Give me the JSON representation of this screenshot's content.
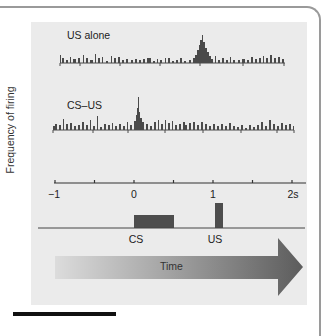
{
  "figure": {
    "y_axis_label": "Frequency of firing",
    "traces": [
      {
        "label": "US alone",
        "peak_at_s": 1.1,
        "description": "peri-stimulus histogram; response peak after US onset"
      },
      {
        "label": "CS–US",
        "peak_at_s": 0.1,
        "description": "peri-stimulus histogram; response peak shifted to CS onset"
      }
    ],
    "time_axis": {
      "ticks": [
        "−1",
        "0",
        "1",
        "2s"
      ],
      "minor_ticks_at": [
        -0.5,
        0.5,
        1.5
      ]
    },
    "events": [
      {
        "label": "CS",
        "start_s": 0,
        "end_s": 0.5
      },
      {
        "label": "US",
        "start_s": 1.0,
        "end_s": 1.1
      }
    ],
    "arrow_label": "Time",
    "colors": {
      "panel_bg": "#ebebeb",
      "histogram": "#4a4a4a",
      "event_block": "#4d4d4d",
      "arrow_start": "#dcdcdc",
      "arrow_end": "#5c5c5c",
      "frame": "#9a9a9a"
    }
  }
}
